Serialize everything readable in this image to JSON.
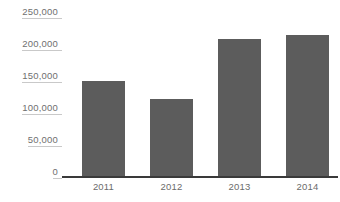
{
  "chart_data": {
    "type": "bar",
    "title": "",
    "subtitle": "",
    "xlabel": "",
    "ylabel": "",
    "categories": [
      "2011",
      "2012",
      "2013",
      "2014"
    ],
    "values": [
      135000,
      110000,
      195000,
      200000
    ],
    "series": [
      {
        "name": "",
        "values": [
          135000,
          110000,
          195000,
          200000
        ]
      }
    ],
    "ylim": [
      0,
      250000
    ],
    "ytick_values": [
      250000,
      200000,
      150000,
      100000,
      50000,
      0
    ],
    "ytick_labels": [
      "250,000",
      "200,000",
      "150,000",
      "100,000",
      "50,000",
      "0"
    ],
    "grid": false,
    "legend": false,
    "legend_position": "none",
    "annotations": [],
    "colors": {
      "bar": "#5c5c5c",
      "axis_line": "#3a3a3a",
      "tick_label": "#6f6f6f",
      "category_label": "#6b6b6b",
      "tick_rule": "#c9c9c9",
      "background": "#ffffff"
    }
  }
}
